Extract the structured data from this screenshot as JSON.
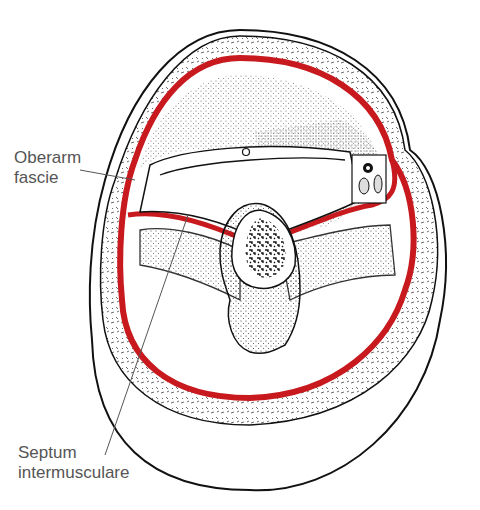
{
  "diagram": {
    "labels": [
      {
        "id": "oberarm-fascie",
        "lines": [
          "Oberarm",
          "fascie"
        ]
      },
      {
        "id": "septum-intermusculare",
        "lines": [
          "Septum",
          "intermusculare"
        ]
      }
    ],
    "colors": {
      "fascia_red": "#c8191e",
      "line": "#1a1a1a",
      "label_text": "#555555",
      "background": "#ffffff"
    }
  }
}
